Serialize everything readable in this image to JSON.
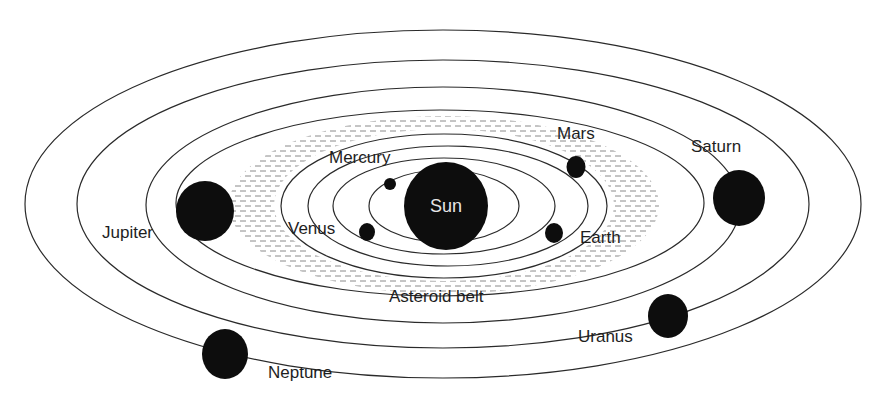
{
  "diagram": {
    "type": "solar-system",
    "center": {
      "x": 446,
      "y": 206
    },
    "colors": {
      "background": "#ffffff",
      "planet": "#0d0d0d",
      "orbit": "#2a2a2a",
      "belt": "#8a8a8a",
      "sun_label": "#e6e6e6",
      "label": "#1e1e1e"
    },
    "sun": {
      "label": "Sun",
      "cx": 446,
      "cy": 206,
      "rx": 42,
      "ry": 44
    },
    "orbits": [
      {
        "name": "Mercury",
        "cx": 444,
        "cy": 206,
        "rx": 75,
        "ry": 36
      },
      {
        "name": "Venus",
        "cx": 444,
        "cy": 206,
        "rx": 111,
        "ry": 48
      },
      {
        "name": "Earth",
        "cx": 448,
        "cy": 206,
        "rx": 140,
        "ry": 60
      },
      {
        "name": "Mars",
        "cx": 444,
        "cy": 206,
        "rx": 163,
        "ry": 72
      },
      {
        "name": "Jupiter",
        "cx": 440,
        "cy": 203,
        "rx": 264,
        "ry": 93
      },
      {
        "name": "Saturn",
        "cx": 443,
        "cy": 205,
        "rx": 297,
        "ry": 118
      },
      {
        "name": "Uranus",
        "cx": 443,
        "cy": 204,
        "rx": 366,
        "ry": 144
      },
      {
        "name": "Neptune",
        "cx": 443,
        "cy": 204,
        "rx": 418,
        "ry": 174
      }
    ],
    "planets": [
      {
        "name": "Mercury",
        "label": "Mercury",
        "cx": 390,
        "cy": 184,
        "rx": 6,
        "ry": 6,
        "label_x": 329,
        "label_y": 163
      },
      {
        "name": "Venus",
        "label": "Venus",
        "cx": 367,
        "cy": 232,
        "rx": 8,
        "ry": 9,
        "label_x": 288,
        "label_y": 234
      },
      {
        "name": "Earth",
        "label": "Earth",
        "cx": 554,
        "cy": 233,
        "rx": 9,
        "ry": 10,
        "label_x": 580,
        "label_y": 243
      },
      {
        "name": "Mars",
        "label": "Mars",
        "cx": 576,
        "cy": 167,
        "rx": 9.5,
        "ry": 11,
        "label_x": 557,
        "label_y": 139
      },
      {
        "name": "Jupiter",
        "label": "Jupiter",
        "cx": 205,
        "cy": 211,
        "rx": 29,
        "ry": 30,
        "label_x": 102,
        "label_y": 238
      },
      {
        "name": "Saturn",
        "label": "Saturn",
        "cx": 739,
        "cy": 198,
        "rx": 26,
        "ry": 28,
        "label_x": 691,
        "label_y": 152
      },
      {
        "name": "Uranus",
        "label": "Uranus",
        "cx": 668,
        "cy": 316,
        "rx": 20,
        "ry": 22,
        "label_x": 578,
        "label_y": 342
      },
      {
        "name": "Neptune",
        "label": "Neptune",
        "cx": 225,
        "cy": 354,
        "rx": 23,
        "ry": 25,
        "label_x": 268,
        "label_y": 378
      }
    ],
    "asteroid_belt": {
      "label": "Asteroid belt",
      "label_x": 389,
      "label_y": 302,
      "inner_rx": 170,
      "inner_ry": 76,
      "outer_rx": 215,
      "outer_ry": 89,
      "cx": 444,
      "cy": 205
    }
  }
}
